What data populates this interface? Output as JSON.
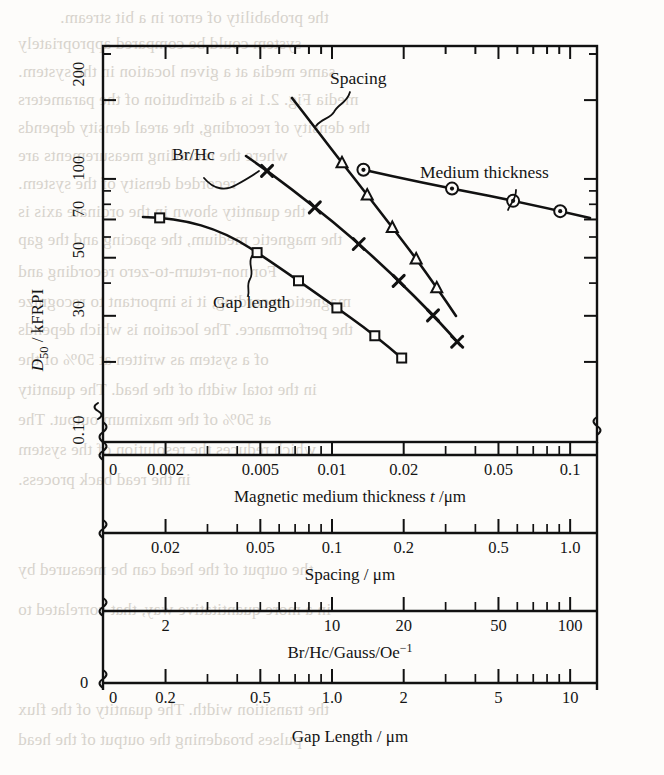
{
  "figure": {
    "y_axis": {
      "title": "D_50 / kFRPI",
      "title_main": "D",
      "title_sub": "50",
      "title_rest": " / kFRPI",
      "tick_labels": [
        "200",
        "100",
        "70",
        "50",
        "30",
        "0.10"
      ],
      "zero_label": "0"
    },
    "x_axes": [
      {
        "name": "medium-thickness-axis",
        "title": "Magnetic medium thickness t /μm",
        "title_pre": "Magnetic medium thickness ",
        "title_var": "t",
        "title_post": " /μm",
        "tick_labels": [
          "0",
          "0.002",
          "0.005",
          "0.01",
          "0.02",
          "0.05",
          "0.1"
        ],
        "tick_values": [
          0,
          0.002,
          0.005,
          0.01,
          0.02,
          0.05,
          0.1
        ],
        "scale": "log"
      },
      {
        "name": "spacing-axis",
        "title": "Spacing / μm",
        "tick_labels": [
          "0.02",
          "0.05",
          "0.1",
          "0.2",
          "0.5",
          "1.0"
        ],
        "tick_values": [
          0.02,
          0.05,
          0.1,
          0.2,
          0.5,
          1.0
        ],
        "scale": "log"
      },
      {
        "name": "br-hc-axis",
        "title": "Br/Hc/Gauss/Oe⁻¹",
        "title_pre": "Br/Hc/Gauss/Oe",
        "title_sup": "−1",
        "tick_labels": [
          "2",
          "10",
          "20",
          "50",
          "100"
        ],
        "tick_values": [
          2,
          10,
          20,
          50,
          100
        ],
        "scale": "log"
      },
      {
        "name": "gap-length-axis",
        "title": "Gap Length / μm",
        "tick_labels": [
          "0",
          "0.2",
          "0.5",
          "1.0",
          "2",
          "5",
          "10"
        ],
        "tick_values": [
          0,
          0.2,
          0.5,
          1.0,
          2,
          5,
          10
        ],
        "scale": "log"
      }
    ],
    "curve_labels": [
      {
        "name": "spacing-label",
        "text": "Spacing"
      },
      {
        "name": "br-hc-label",
        "text": "Br/Hc"
      },
      {
        "name": "medium-thickness-label",
        "text": "Medium thickness"
      },
      {
        "name": "gap-length-label",
        "text": "Gap length"
      }
    ]
  },
  "chart_data": {
    "type": "line",
    "title": "",
    "subtitle": "",
    "xlabel": "Magnetic medium thickness t /μm  (plus Spacing /μm, Br/Hc/Gauss/Oe⁻¹, Gap Length /μm)",
    "ylabel": "D50 / kFRPI",
    "yscale": "log",
    "xscale": "log",
    "ylim": [
      10,
      300
    ],
    "ytick_values": [
      200,
      100,
      70,
      50,
      30,
      10
    ],
    "ytick_labels": [
      "200",
      "100",
      "70",
      "50",
      "30",
      "0.10"
    ],
    "grid": false,
    "legend": "inline-callout-labels",
    "series": [
      {
        "name": "Gap length",
        "marker": "open-square",
        "axis": "gap-length-axis",
        "axis_units": "μm",
        "x": [
          0.16,
          0.5,
          0.8,
          1.3,
          2.0,
          3.2
        ],
        "y": [
          70,
          57,
          50,
          43,
          34,
          23
        ],
        "point_labels": [
          "",
          "",
          "",
          "",
          "",
          ""
        ]
      },
      {
        "name": "Br/Hc",
        "marker": "x-cross",
        "axis": "br-hc-axis",
        "axis_units": "Gauss/Oe⁻¹",
        "x": [
          5.0,
          8.0,
          11.5,
          16.0,
          22.0,
          31.0
        ],
        "y": [
          120,
          86,
          68,
          56,
          44,
          30
        ],
        "point_labels": [
          "",
          "",
          "",
          "",
          "",
          ""
        ]
      },
      {
        "name": "Spacing",
        "marker": "open-triangle",
        "axis": "spacing-axis",
        "axis_units": "μm",
        "x": [
          0.1,
          0.13,
          0.16,
          0.2,
          0.26
        ],
        "y": [
          75,
          66,
          58,
          50,
          43
        ],
        "point_labels": [
          "",
          "",
          "",
          "",
          ""
        ]
      },
      {
        "name": "Medium thickness",
        "marker": "circled-dot",
        "axis": "medium-thickness-axis",
        "axis_units": "μm",
        "x": [
          0.011,
          0.03,
          0.055,
          0.08
        ],
        "y": [
          100,
          75,
          66,
          61
        ],
        "point_labels": [
          "",
          "",
          "",
          ""
        ]
      }
    ]
  },
  "bleed_text": {
    "lines": [
      "the probability of error in a bit stream.",
      "system could be compared appropriately",
      "same media at a given location in the system.",
      "media  Fig. 2.1 is a distribution of the parameters",
      "the density of recording, the areal density depends",
      "where the recording measurements are",
      "recorded density of the system.",
      "the quantity shown in the ordinate axis is",
      "the magnetic medium, the spacing and the gap",
      "For non-return-to-zero recording and",
      "magnetic recording, it is important to recognize",
      "the performance. The location is which depends",
      "of a system as written at 50% of the",
      "in the total width of the head. The quantity",
      "at 50% of the maximum output. The",
      "which reduces the resolution of the system",
      "in the read back process.",
      "the output of the head can be measured by",
      "in a more quantitative way, that correlated to",
      "the transition width. The quantity of the flux",
      "pulses broadening the output of the head"
    ]
  }
}
